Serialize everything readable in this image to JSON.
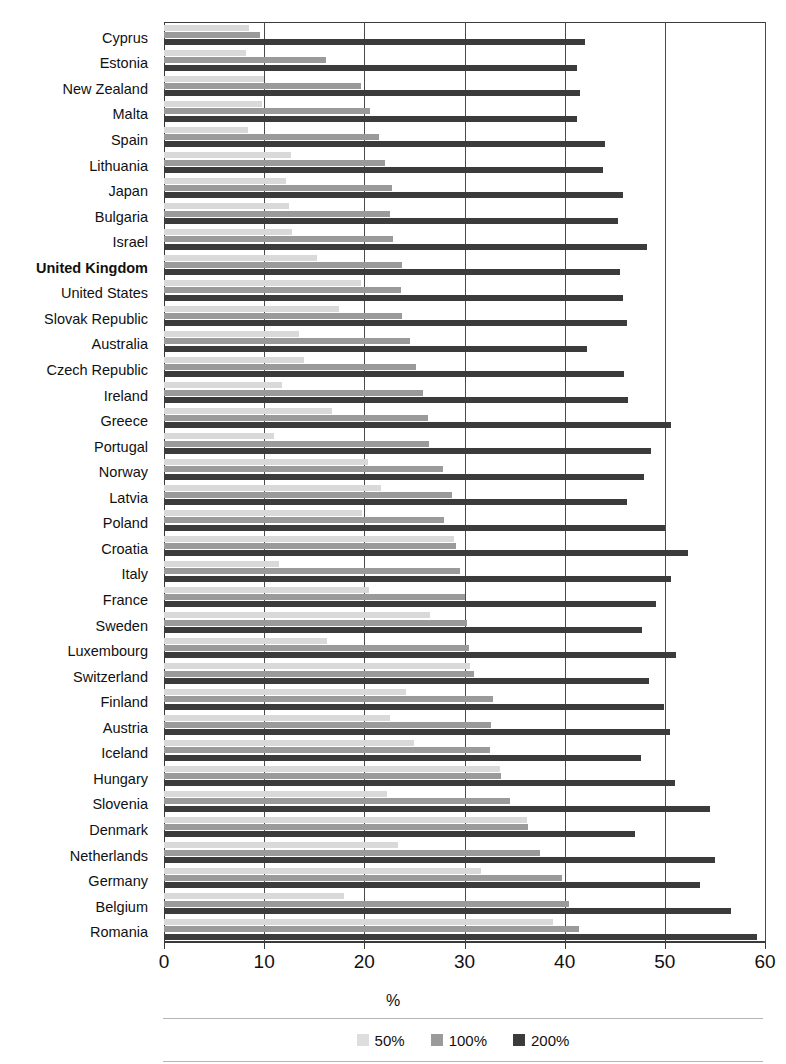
{
  "chart_data": {
    "type": "bar",
    "orientation": "horizontal",
    "title": "",
    "xlabel": "%",
    "ylabel": "",
    "xlim": [
      0,
      60
    ],
    "xticks": [
      0,
      10,
      20,
      30,
      40,
      50,
      60
    ],
    "grid": true,
    "legend_position": "bottom",
    "highlight_category": "United Kingdom",
    "colors": {
      "s50": "#dedede",
      "s100": "#9a9a9a",
      "s200": "#3b3b3b"
    },
    "categories": [
      "Cyprus",
      "Estonia",
      "New Zealand",
      "Malta",
      "Spain",
      "Lithuania",
      "Japan",
      "Bulgaria",
      "Israel",
      "United Kingdom",
      "United States",
      "Slovak Republic",
      "Australia",
      "Czech Republic",
      "Ireland",
      "Greece",
      "Portugal",
      "Norway",
      "Latvia",
      "Poland",
      "Croatia",
      "Italy",
      "France",
      "Sweden",
      "Luxembourg",
      "Switzerland",
      "Finland",
      "Austria",
      "Iceland",
      "Hungary",
      "Slovenia",
      "Denmark",
      "Netherlands",
      "Germany",
      "Belgium",
      "Romania"
    ],
    "series": [
      {
        "name": "50%",
        "values": [
          8.5,
          8.2,
          10.0,
          9.8,
          8.4,
          12.7,
          12.2,
          12.5,
          12.8,
          15.3,
          19.7,
          17.5,
          13.5,
          14.0,
          11.8,
          16.8,
          11.0,
          20.4,
          21.7,
          19.8,
          29.0,
          11.5,
          20.5,
          26.6,
          16.3,
          30.5,
          24.2,
          22.6,
          25.0,
          33.5,
          22.3,
          36.2,
          23.4,
          31.6,
          18.0,
          38.8
        ]
      },
      {
        "name": "100%",
        "values": [
          9.6,
          16.2,
          19.7,
          20.6,
          21.5,
          22.1,
          22.8,
          22.6,
          22.9,
          23.8,
          23.7,
          23.8,
          24.6,
          25.2,
          25.9,
          26.4,
          26.5,
          27.9,
          28.8,
          28.0,
          29.2,
          29.6,
          30.0,
          30.2,
          30.4,
          30.9,
          32.8,
          32.6,
          32.5,
          33.6,
          34.5,
          36.3,
          37.5,
          39.7,
          40.4,
          41.4
        ]
      },
      {
        "name": "200%",
        "values": [
          42.0,
          41.2,
          41.5,
          41.2,
          44.0,
          43.8,
          45.8,
          45.3,
          48.2,
          45.5,
          45.8,
          46.2,
          42.2,
          45.9,
          46.3,
          50.6,
          48.6,
          47.9,
          46.2,
          50.0,
          52.3,
          50.6,
          49.1,
          47.7,
          51.1,
          48.4,
          49.9,
          50.5,
          47.6,
          51.0,
          54.5,
          47.0,
          55.0,
          53.5,
          56.6,
          59.2
        ]
      }
    ]
  },
  "legend": {
    "items": [
      {
        "label": "50%",
        "key": "s50"
      },
      {
        "label": "100%",
        "key": "s100"
      },
      {
        "label": "200%",
        "key": "s200"
      }
    ]
  }
}
